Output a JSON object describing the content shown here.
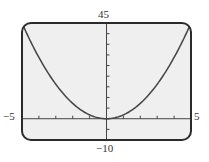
{
  "chart_data": {
    "type": "line",
    "title": "",
    "xlabel": "",
    "ylabel": "",
    "xlim": [
      -5,
      5
    ],
    "ylim": [
      -10,
      45
    ],
    "x_tick_step": 1,
    "y_tick_step": 5,
    "window_labels": {
      "xmin": "−5",
      "xmax": "5",
      "ymin": "−10",
      "ymax": "45"
    },
    "grid": false,
    "legend": null,
    "series": [
      {
        "name": "y = 1.8x²",
        "x": [
          -5,
          -4,
          -3,
          -2,
          -1,
          0,
          1,
          2,
          3,
          4,
          5
        ],
        "values": [
          45,
          28.8,
          16.2,
          7.2,
          1.8,
          0,
          1.8,
          7.2,
          16.2,
          28.8,
          45
        ]
      }
    ]
  },
  "colors": {
    "frame": "#2b2b2b",
    "screen": "#efefef",
    "curve": "#444444",
    "axis": "#444444"
  }
}
